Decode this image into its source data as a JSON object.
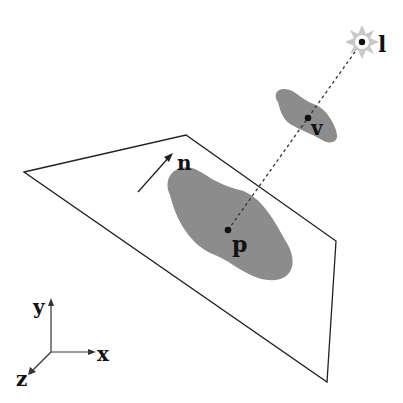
{
  "diagram": {
    "labels": {
      "light": "l",
      "occluder_point": "v",
      "surface_point": "p",
      "normal": "n",
      "axis_x": "x",
      "axis_y": "y",
      "axis_z": "z"
    },
    "colors": {
      "background": "#ffffff",
      "line": "#222222",
      "blob": "#8c8c8c",
      "light_rays": "#c8c8c8",
      "text": "#111111"
    },
    "plane_corners": [
      [
        24,
        172
      ],
      [
        186,
        135
      ],
      [
        336,
        241
      ],
      [
        327,
        382
      ]
    ],
    "points": {
      "light": [
        362,
        42
      ],
      "v": [
        308,
        118
      ],
      "p": [
        228,
        230
      ]
    }
  }
}
